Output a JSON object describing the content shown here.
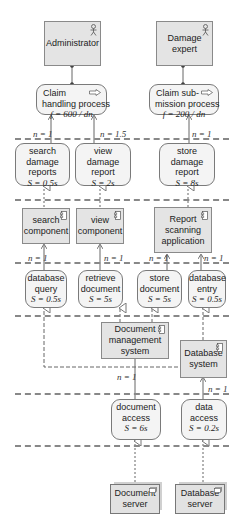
{
  "actors": [
    {
      "label": "Administrator",
      "icon": "actor-icon"
    },
    {
      "label": "Damage expert",
      "icon": "actor-icon"
    }
  ],
  "processes": [
    {
      "line1": "Claim",
      "line2": "handling process",
      "formula": "f = 600 / dn",
      "icon": "process-arrow-icon"
    },
    {
      "line1": "Claim sub-",
      "line2": "mission process",
      "formula": "f = 200 / dn",
      "icon": "process-arrow-icon"
    }
  ],
  "app_services": [
    {
      "label": "search damage reports",
      "l1": "search",
      "l2": "damage",
      "l3": "reports",
      "formula": "S = 0.5s"
    },
    {
      "label": "view damage report",
      "l1": "view",
      "l2": "damage",
      "l3": "report",
      "formula": "S = 2s"
    },
    {
      "label": "store damage report",
      "l1": "store",
      "l2": "damage",
      "l3": "report",
      "formula": "S = 8s"
    }
  ],
  "components": [
    {
      "l1": "search",
      "l2": "component",
      "l3": ""
    },
    {
      "l1": "view",
      "l2": "component",
      "l3": ""
    },
    {
      "l1": "Report",
      "l2": "scanning",
      "l3": "application"
    }
  ],
  "infra_services": [
    {
      "l1": "database",
      "l2": "query",
      "formula": "S = 0.5s"
    },
    {
      "l1": "retrieve",
      "l2": "document",
      "formula": "S = 5s"
    },
    {
      "l1": "store",
      "l2": "document",
      "formula": "S = 5s"
    },
    {
      "l1": "database",
      "l2": "entry",
      "formula": "S = 0.5s"
    }
  ],
  "systems": [
    {
      "l1": "Document",
      "l2": "management",
      "l3": "system"
    },
    {
      "l1": "Database",
      "l2": "system",
      "l3": ""
    }
  ],
  "access_services": [
    {
      "l1": "document",
      "l2": "access",
      "formula": "S = 6s"
    },
    {
      "l1": "data",
      "l2": "access",
      "formula": "S = 0.2s"
    }
  ],
  "nodes": [
    {
      "l1": "Document",
      "l2": "server"
    },
    {
      "l1": "Database",
      "l2": "server"
    }
  ],
  "n_labels": {
    "search_to_process": "n = 1",
    "view_to_process": "n = 1.5",
    "store_to_process": "n = 1",
    "dbquery_to_search": "n = 1",
    "retrieve_to_view": "n = 1",
    "storedoc_to_report": "n = 1",
    "dbentry_to_report": "n = 1",
    "docaccess_to_dms": "n = 1",
    "dataaccess_to_db": "n = 1"
  },
  "colors": {
    "box_fill": "#e4e4e4",
    "service_fill": "#f4f4f4",
    "border": "#7a7a7a",
    "dashed_line": "#888888"
  }
}
